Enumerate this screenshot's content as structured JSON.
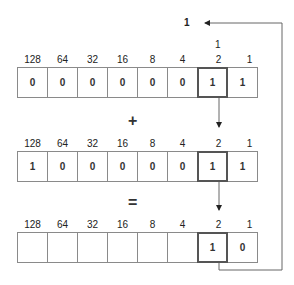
{
  "carry_out": "1",
  "carry_in": "1",
  "place_values": [
    "128",
    "64",
    "32",
    "16",
    "8",
    "4",
    "2",
    "1"
  ],
  "rows": [
    {
      "name": "addend-a",
      "bits": [
        "0",
        "0",
        "0",
        "0",
        "0",
        "0",
        "1",
        "1"
      ]
    },
    {
      "name": "addend-b",
      "bits": [
        "1",
        "0",
        "0",
        "0",
        "0",
        "0",
        "1",
        "1"
      ]
    },
    {
      "name": "sum",
      "bits": [
        "",
        "",
        "",
        "",
        "",
        "",
        "1",
        "0"
      ]
    }
  ],
  "operators": {
    "plus": "+",
    "equals": "="
  },
  "highlight_column": "2"
}
